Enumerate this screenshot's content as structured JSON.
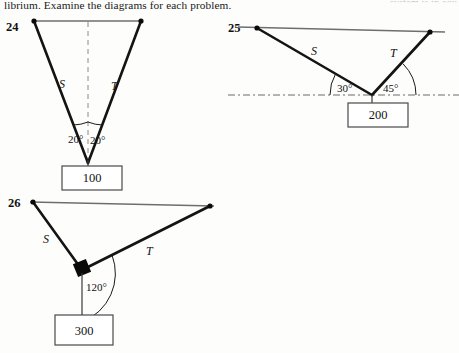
{
  "page": {
    "header_text": "librium.  Examine the diagrams for each problem.",
    "header_cut_text": "system is in equ"
  },
  "problems": [
    {
      "number": "24",
      "cable_labels": {
        "left": "S",
        "right": "T"
      },
      "angles": [
        {
          "value": "20°",
          "side": "left"
        },
        {
          "value": "20°",
          "side": "right"
        }
      ],
      "weight": "100",
      "reference_line": "vertical-dashed"
    },
    {
      "number": "25",
      "cable_labels": {
        "left": "S",
        "right": "T"
      },
      "angles": [
        {
          "value": "30°",
          "side": "left"
        },
        {
          "value": "45°",
          "side": "right"
        }
      ],
      "weight": "200",
      "reference_line": "horizontal-dashed"
    },
    {
      "number": "26",
      "cable_labels": {
        "left": "S",
        "right": "T"
      },
      "angles": [
        {
          "value": "120°",
          "side": "junction"
        }
      ],
      "weight": "300",
      "reference_line": "none"
    }
  ]
}
